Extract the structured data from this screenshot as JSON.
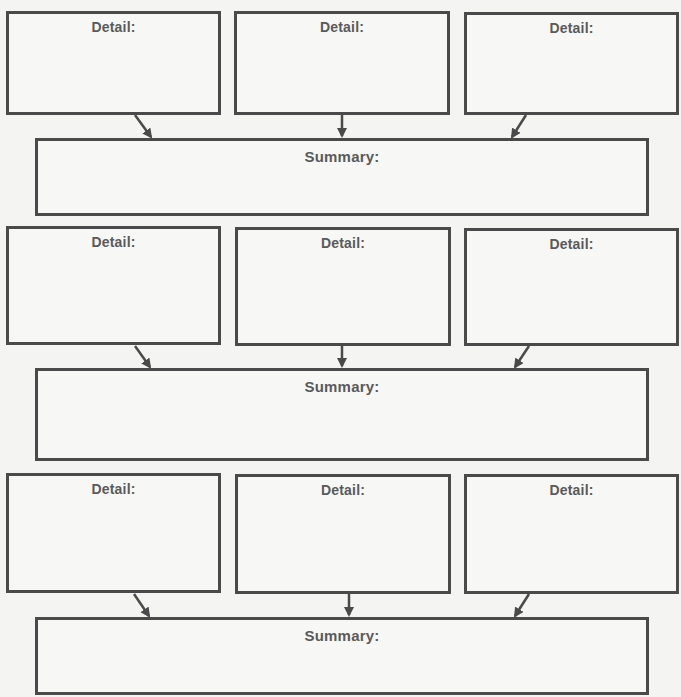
{
  "diagram": {
    "type": "detail-summary organizer",
    "colors": {
      "stroke": "#4a4a4a",
      "text": "#5a5a5a",
      "background": "#f4f4f2"
    },
    "groups": [
      {
        "details": [
          {
            "label": "Detail:",
            "content": ""
          },
          {
            "label": "Detail:",
            "content": ""
          },
          {
            "label": "Detail:",
            "content": ""
          }
        ],
        "summary": {
          "label": "Summary:",
          "content": ""
        }
      },
      {
        "details": [
          {
            "label": "Detail:",
            "content": ""
          },
          {
            "label": "Detail:",
            "content": ""
          },
          {
            "label": "Detail:",
            "content": ""
          }
        ],
        "summary": {
          "label": "Summary:",
          "content": ""
        }
      },
      {
        "details": [
          {
            "label": "Detail:",
            "content": ""
          },
          {
            "label": "Detail:",
            "content": ""
          },
          {
            "label": "Detail:",
            "content": ""
          }
        ],
        "summary": {
          "label": "Summary:",
          "content": ""
        }
      }
    ]
  }
}
